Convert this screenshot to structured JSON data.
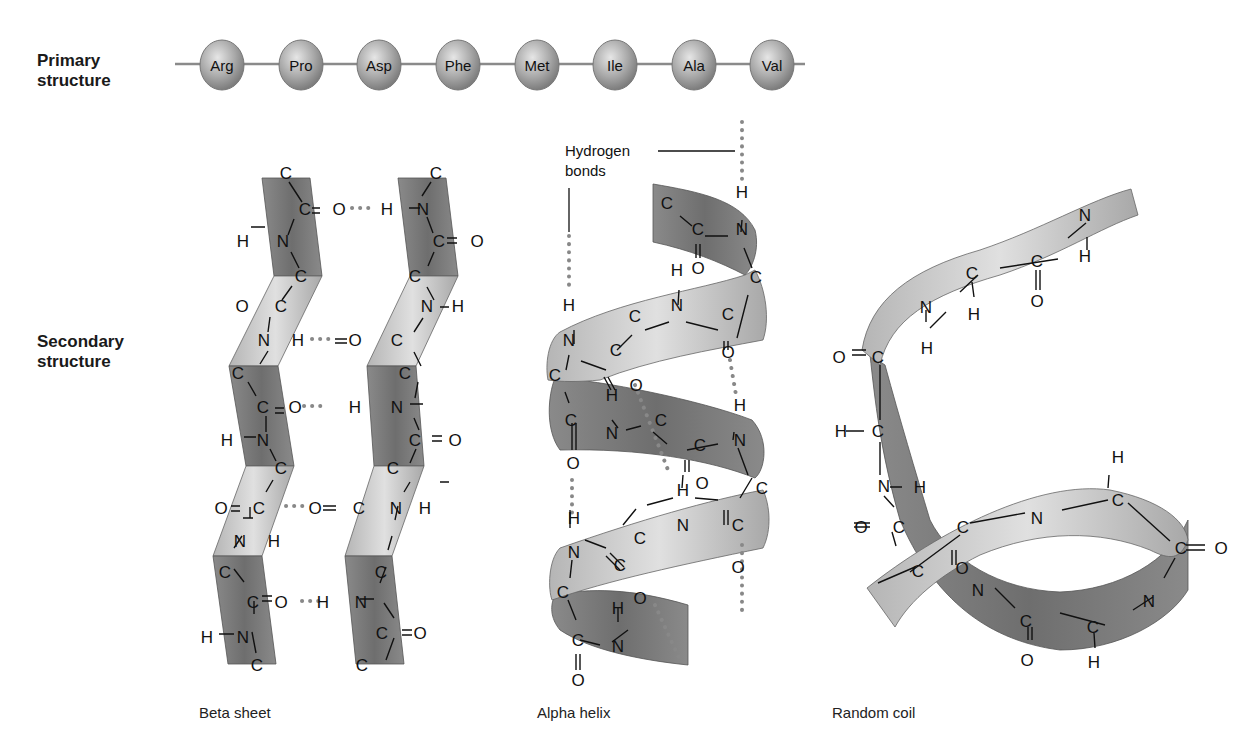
{
  "labels": {
    "primary_line1": "Primary",
    "primary_line2": "structure",
    "secondary_line1": "Secondary",
    "secondary_line2": "structure",
    "hydrogen_line1": "Hydrogen",
    "hydrogen_line2": "bonds"
  },
  "primary_structure": {
    "residues": [
      "Arg",
      "Pro",
      "Asp",
      "Phe",
      "Met",
      "Ile",
      "Ala",
      "Val"
    ]
  },
  "secondary_structure": {
    "captions": {
      "beta_sheet": "Beta sheet",
      "alpha_helix": "Alpha helix",
      "random_coil": "Random coil"
    }
  },
  "atoms": {
    "C": "C",
    "N": "N",
    "O": "O",
    "H": "H"
  },
  "colors": {
    "ribbon_dark": "#7a7a7a",
    "ribbon_light": "#c8c8c8",
    "bead": "#a9a9a9",
    "hbond": "#888888"
  }
}
